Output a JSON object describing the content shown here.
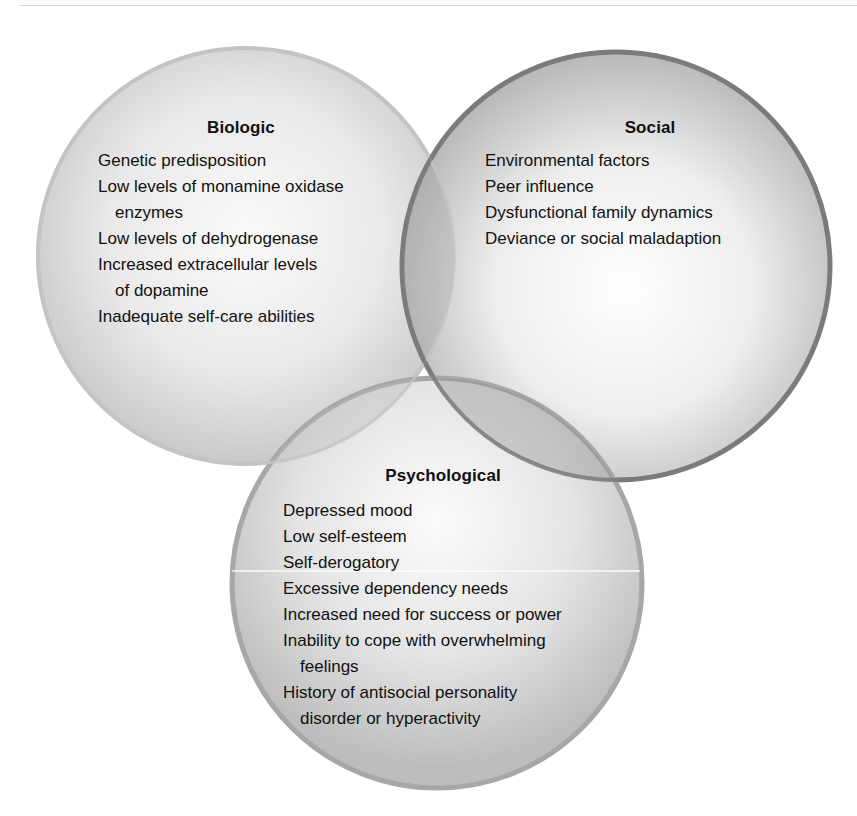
{
  "diagram": {
    "type": "venn",
    "circles": [
      {
        "id": "biologic",
        "title": "Biologic",
        "items": [
          "Genetic predisposition",
          "Low levels of monamine oxidase enzymes",
          "Low levels of dehydrogenase",
          "Increased extracellular levels of dopamine",
          "Inadequate self-care abilities"
        ],
        "display_lines": [
          "Genetic predisposition",
          "Low levels of monamine oxidase",
          "enzymes",
          "Low levels of dehydrogenase",
          "Increased extracellular levels",
          "of dopamine",
          "Inadequate self-care abilities"
        ]
      },
      {
        "id": "social",
        "title": "Social",
        "items": [
          "Environmental factors",
          "Peer influence",
          "Dysfunctional family dynamics",
          "Deviance or social maladaption"
        ],
        "display_lines": [
          "Environmental factors",
          "Peer influence",
          "Dysfunctional family dynamics",
          "Deviance or social maladaption"
        ]
      },
      {
        "id": "psychological",
        "title": "Psychological",
        "items": [
          "Depressed mood",
          "Low self-esteem",
          "Self-derogatory",
          "Excessive dependency needs",
          "Increased need for success or power",
          "Inability to cope with overwhelming feelings",
          "History of antisocial personality disorder or hyperactivity"
        ],
        "display_lines": [
          "Depressed mood",
          "Low self-esteem",
          "Self-derogatory",
          "Excessive dependency needs",
          "Increased need for success or power",
          "Inability to cope with overwhelming",
          "feelings",
          "History of antisocial personality",
          "disorder or hyperactivity"
        ]
      }
    ],
    "colors": {
      "biologic_edge": "#b9b9b9",
      "social_edge": "#7f7f7f",
      "psychological_edge": "#a3a3a3",
      "fill_light": "#f7f7f7",
      "fill_mid": "#d4d4d4",
      "text": "#111111"
    }
  }
}
